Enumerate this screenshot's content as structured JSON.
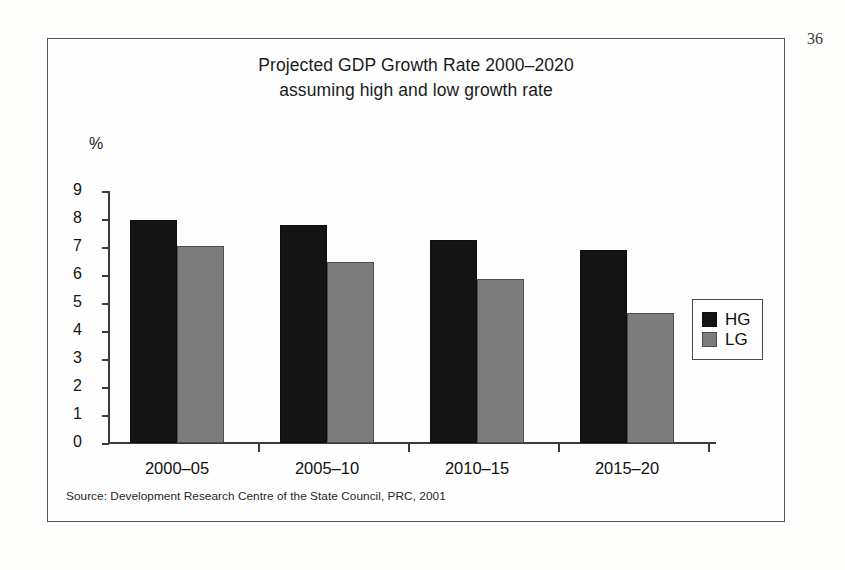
{
  "page": {
    "number": "36"
  },
  "figure": {
    "title_line1": "Projected GDP Growth Rate 2000–2020",
    "title_line2": "assuming high and low growth rate",
    "source": "Source: Development Research Centre of the State Council, PRC, 2001"
  },
  "chart_data": {
    "type": "bar",
    "title": "Projected GDP Growth Rate 2000–2020 assuming high and low growth rate",
    "subtitle": "assuming high and low growth rate",
    "xlabel": "",
    "ylabel": "%",
    "ylim": [
      0,
      9
    ],
    "yticks": [
      "0",
      "1",
      "2",
      "3",
      "4",
      "5",
      "6",
      "7",
      "8",
      "9"
    ],
    "ytick_values": [
      0,
      1,
      2,
      3,
      4,
      5,
      6,
      7,
      8,
      9
    ],
    "grid": false,
    "legend_position": "right",
    "categories": [
      "2000–05",
      "2005–10",
      "2010–15",
      "2015–20"
    ],
    "series": [
      {
        "name": "HG",
        "color": "#141414",
        "values": [
          7.95,
          7.8,
          7.25,
          6.9
        ]
      },
      {
        "name": "LG",
        "color": "#7c7c7c",
        "values": [
          7.05,
          6.45,
          5.85,
          4.65
        ]
      }
    ],
    "annotations": [
      "Source: Development Research Centre of the State Council, PRC, 2001"
    ]
  }
}
